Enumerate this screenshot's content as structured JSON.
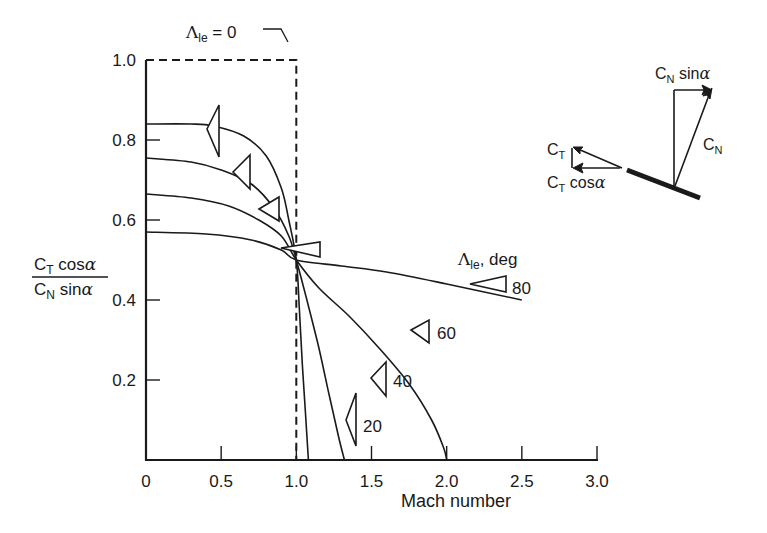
{
  "chart_data": {
    "type": "line",
    "title": "",
    "xlabel": "Mach number",
    "ylabel": "C_T cosα / C_N sinα",
    "ylabel_parts": {
      "numerator": {
        "C": "C",
        "sub": "T",
        "rest": " cos",
        "greek": "α"
      },
      "denominator": {
        "C": "C",
        "sub": "N",
        "rest": " sin",
        "greek": "α"
      }
    },
    "xlim": [
      0,
      3.0
    ],
    "ylim": [
      0,
      1.0
    ],
    "x_ticks": [
      "0",
      "0.5",
      "1.0",
      "1.5",
      "2.0",
      "2.5",
      "3.0"
    ],
    "y_ticks": [
      "0.2",
      "0.4",
      "0.6",
      "0.8",
      "1.0"
    ],
    "grid": false,
    "legend_title": "Λ",
    "legend_title_sub": "le",
    "legend_title_rest": ", deg",
    "reference_line": {
      "label": "Λ",
      "label_sub": "le",
      "label_rest": " = 0",
      "style": "dashed",
      "description": "Step: 1.0 for M < 1, 0 for M > 1",
      "points": [
        [
          0,
          1.0
        ],
        [
          1.0,
          1.0
        ],
        [
          1.0,
          0.0
        ]
      ]
    },
    "series": [
      {
        "name": "20",
        "label": "20",
        "points": [
          [
            0,
            0.84
          ],
          [
            0.3,
            0.84
          ],
          [
            0.45,
            0.835
          ],
          [
            0.65,
            0.81
          ],
          [
            0.8,
            0.76
          ],
          [
            0.9,
            0.68
          ],
          [
            0.95,
            0.6
          ],
          [
            1.0,
            0.5
          ],
          [
            1.02,
            0.38
          ],
          [
            1.04,
            0.24
          ],
          [
            1.06,
            0.12
          ],
          [
            1.08,
            0.0
          ]
        ]
      },
      {
        "name": "40",
        "label": "40",
        "points": [
          [
            0,
            0.755
          ],
          [
            0.3,
            0.745
          ],
          [
            0.5,
            0.725
          ],
          [
            0.7,
            0.69
          ],
          [
            0.85,
            0.63
          ],
          [
            0.95,
            0.56
          ],
          [
            1.0,
            0.5
          ],
          [
            1.07,
            0.4
          ],
          [
            1.15,
            0.28
          ],
          [
            1.22,
            0.16
          ],
          [
            1.28,
            0.06
          ],
          [
            1.32,
            0.0
          ]
        ]
      },
      {
        "name": "60",
        "label": "60",
        "points": [
          [
            0,
            0.665
          ],
          [
            0.3,
            0.655
          ],
          [
            0.55,
            0.635
          ],
          [
            0.75,
            0.6
          ],
          [
            0.9,
            0.56
          ],
          [
            1.0,
            0.5
          ],
          [
            1.15,
            0.43
          ],
          [
            1.35,
            0.36
          ],
          [
            1.55,
            0.28
          ],
          [
            1.75,
            0.19
          ],
          [
            1.9,
            0.1
          ],
          [
            1.98,
            0.03
          ],
          [
            2.0,
            0.0
          ]
        ]
      },
      {
        "name": "80",
        "label": "80",
        "points": [
          [
            0,
            0.57
          ],
          [
            0.4,
            0.565
          ],
          [
            0.7,
            0.55
          ],
          [
            0.9,
            0.525
          ],
          [
            1.0,
            0.5
          ],
          [
            1.3,
            0.485
          ],
          [
            1.6,
            0.47
          ],
          [
            2.0,
            0.44
          ],
          [
            2.5,
            0.4
          ]
        ]
      }
    ],
    "annotations": [
      {
        "type": "inset-diagram",
        "labels": [
          "C_N sinα",
          "C_N",
          "C_T",
          "C_T cosα"
        ]
      }
    ]
  },
  "inset": {
    "cn_sin": {
      "C": "C",
      "sub": "N",
      "rest": " sin",
      "greek": "α"
    },
    "cn": {
      "C": "C",
      "sub": "N"
    },
    "ct": {
      "C": "C",
      "sub": "T"
    },
    "ct_cos": {
      "C": "C",
      "sub": "T",
      "rest": " cos",
      "greek": "α"
    }
  },
  "colors": {
    "ink": "#1a1a1a",
    "background": "#ffffff"
  }
}
